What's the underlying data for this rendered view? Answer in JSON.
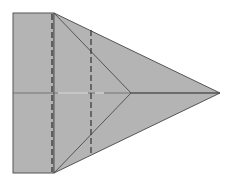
{
  "diagram": {
    "type": "origami-fold-diagram",
    "colors": {
      "paper": "#b4b4b4",
      "edge": "#555555",
      "crease": "#666666",
      "dashed_fold": "#333333",
      "highlight": "#e8e8e8",
      "background": "#ffffff"
    },
    "shapes": {
      "rectangle": {
        "x": 13,
        "y": 13,
        "w": 41,
        "h": 160
      },
      "triangle": {
        "points": "54,13 220,93 54,173"
      },
      "apex": {
        "x": 220,
        "y": 93
      },
      "inner_vertex": {
        "x": 131,
        "y": 93
      },
      "dashed_lines": [
        {
          "x": 52,
          "y1": 13,
          "y2": 173
        },
        {
          "x": 91,
          "y1": 30,
          "y2": 156
        }
      ],
      "center_line": {
        "y": 93,
        "x1": 13,
        "x2": 220
      }
    }
  }
}
